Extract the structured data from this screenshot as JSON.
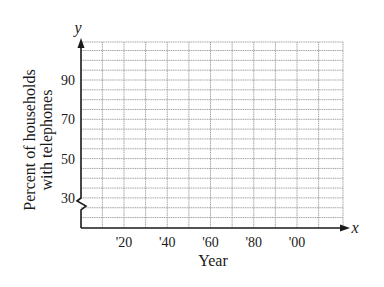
{
  "chart_data": {
    "type": "line",
    "title": "",
    "xlabel": "Year",
    "ylabel": "Percent of households with telephones",
    "ylabel_lines": [
      "Percent of households",
      "with telephones"
    ],
    "x_axis_symbol": "x",
    "y_axis_symbol": "y",
    "x_tick_labels": [
      "'20",
      "'40",
      "'60",
      "'80",
      "'00"
    ],
    "x_tick_years": [
      1920,
      1940,
      1960,
      1980,
      2000
    ],
    "y_tick_labels": [
      "90",
      "70",
      "50",
      "30"
    ],
    "y_tick_values": [
      90,
      70,
      50,
      30
    ],
    "xlim": [
      1900,
      2020
    ],
    "ylim": [
      20,
      105
    ],
    "x_minor_step": 10,
    "y_minor_step": 5,
    "y_axis_break": true,
    "grid": true,
    "series": [],
    "note": "Blank coordinate grid; no data plotted"
  },
  "colors": {
    "axis": "#1a1a1a",
    "grid": "#9a9a9a",
    "text": "#1a1a1a"
  }
}
